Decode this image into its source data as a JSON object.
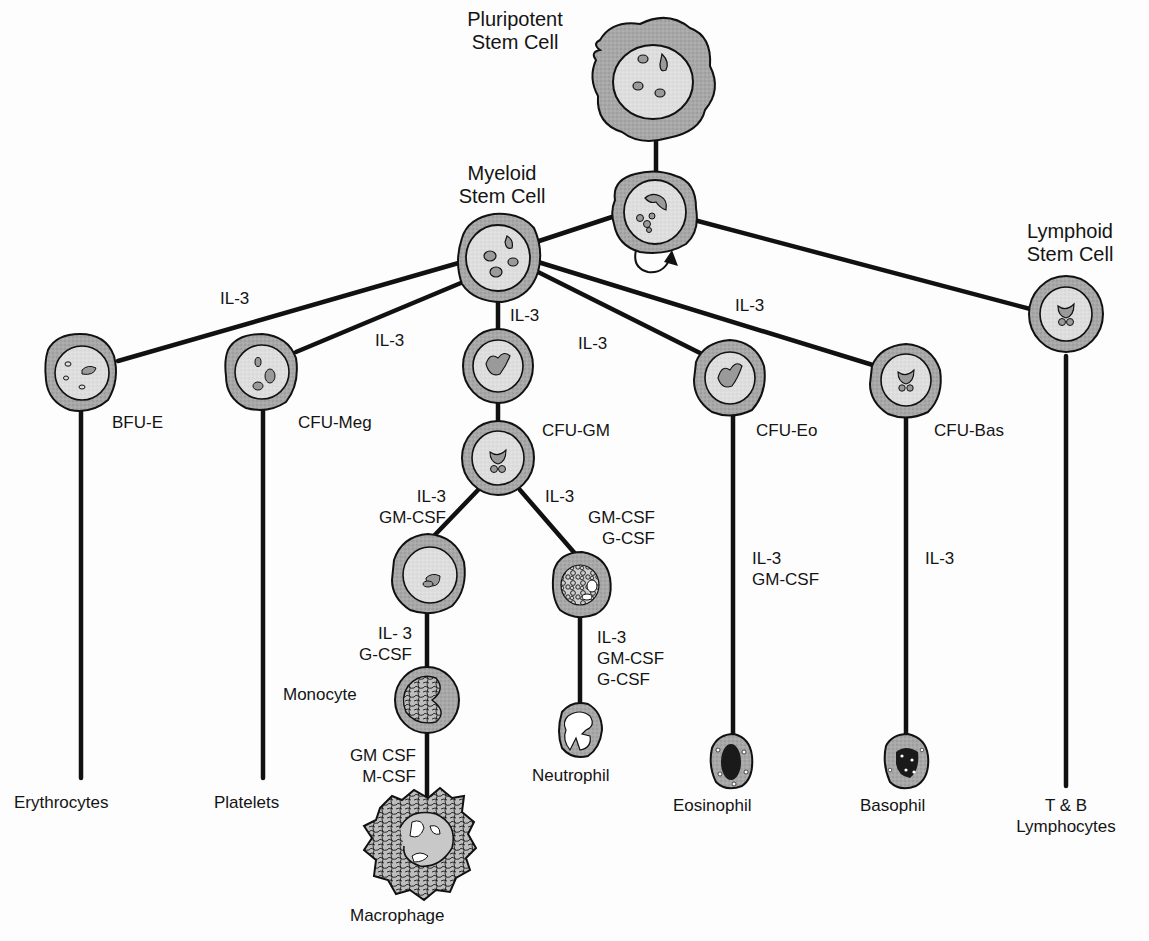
{
  "diagram": {
    "title_nodes": {
      "pluripotent": [
        "Pluripotent",
        "Stem Cell"
      ],
      "myeloid": [
        "Myeloid",
        "Stem Cell"
      ],
      "lymphoid": [
        "Lymphoid",
        "Stem Cell"
      ]
    },
    "progenitors": {
      "bfu_e": "BFU-E",
      "cfu_meg": "CFU-Meg",
      "cfu_gm": "CFU-GM",
      "cfu_eo": "CFU-Eo",
      "cfu_bas": "CFU-Bas"
    },
    "growth_factors": {
      "to_bfu_e": "IL-3",
      "to_cfu_meg": "IL-3",
      "to_gm_precursor": "IL-3",
      "to_cfu_eo": "IL-3",
      "to_cfu_bas": "IL-3",
      "gm_to_mono": [
        "IL-3",
        "GM-CSF"
      ],
      "gm_to_neut": [
        "IL-3",
        "GM-CSF",
        "G-CSF"
      ],
      "mono_precursor": [
        "IL- 3",
        "G-CSF"
      ],
      "neut_precursor": [
        "IL-3",
        "GM-CSF",
        "G-CSF"
      ],
      "eo_path": [
        "IL-3",
        "GM-CSF"
      ],
      "bas_path": "IL-3",
      "macro_path": [
        "GM CSF",
        "M-CSF"
      ]
    },
    "mature_cells": {
      "erythrocytes": "Erythrocytes",
      "platelets": "Platelets",
      "monocyte": "Monocyte",
      "macrophage": "Macrophage",
      "neutrophil": "Neutrophil",
      "eosinophil": "Eosinophil",
      "basophil": "Basophil",
      "lymphocytes": [
        "T & B",
        "Lymphocytes"
      ]
    },
    "self_renewal_icon": "curved-arrow-icon",
    "colors": {
      "line": "#111111",
      "cytoplasm": "#a9a9a9",
      "nucleus": "#dcdcdc",
      "background": "#fdfdfd"
    }
  }
}
